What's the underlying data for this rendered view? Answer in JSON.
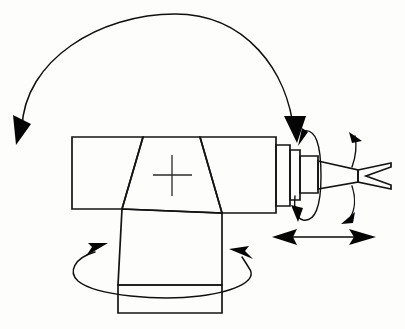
{
  "figure": {
    "kind": "technical-line-drawing",
    "background_color": "#fdfdfb",
    "ink_color": "#141414",
    "width": 405,
    "height": 329
  },
  "machine": {
    "parts": [
      {
        "id": "rear-arm-block",
        "label": "rear arm block"
      },
      {
        "id": "center-housing",
        "label": "center housing"
      },
      {
        "id": "front-arm-block",
        "label": "front arm block"
      },
      {
        "id": "wrist-flange-1",
        "label": "wrist flange 1"
      },
      {
        "id": "wrist-flange-2",
        "label": "wrist flange 2"
      },
      {
        "id": "wrist-flange-3",
        "label": "wrist flange 3"
      },
      {
        "id": "nozzle-cone",
        "label": "tapered nozzle"
      },
      {
        "id": "forked-tip",
        "label": "forked tip"
      },
      {
        "id": "support-column",
        "label": "support column"
      },
      {
        "id": "base-plate",
        "label": "base plate"
      },
      {
        "id": "center-mark",
        "label": "center crosshair mark"
      }
    ]
  },
  "motions": [
    {
      "id": "overhead-swing",
      "label": "overhead swing arc",
      "type": "arc",
      "arrow_ends": "both",
      "direction": "vertical plane sweep"
    },
    {
      "id": "wrist-roll",
      "label": "wrist roll",
      "type": "ellipse-loop",
      "arrow_ends": "both",
      "direction": "roll about tool axis"
    },
    {
      "id": "tool-pitch",
      "label": "tool pitch",
      "type": "arc",
      "arrow_ends": "both",
      "direction": "up and down pivot"
    },
    {
      "id": "linear-travel",
      "label": "linear in-out travel",
      "type": "double-arrow",
      "arrow_ends": "both",
      "direction": "horizontal"
    },
    {
      "id": "base-rotation",
      "label": "base rotation",
      "type": "ellipse-loop",
      "arrow_ends": "both",
      "direction": "yaw about vertical column"
    }
  ],
  "icons": {
    "arrowhead": "solid-triangle-arrowhead",
    "crosshair": "crosshair-icon"
  }
}
